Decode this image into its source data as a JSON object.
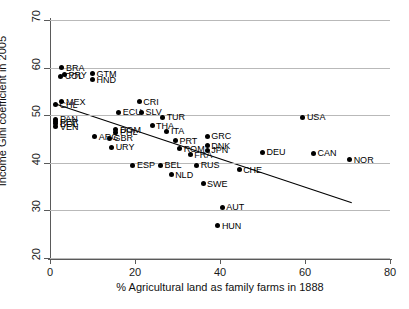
{
  "chart_data": {
    "type": "scatter",
    "title": "",
    "xlabel": "% Agricultural land as family farms in 1888",
    "ylabel": "Income Gini coefficient in 2005",
    "xlim": [
      0,
      80
    ],
    "ylim": [
      20,
      70
    ],
    "xticks": [
      0,
      20,
      40,
      60,
      80
    ],
    "yticks": [
      20,
      30,
      40,
      50,
      60,
      70
    ],
    "grid": "horizontal",
    "legend": "none",
    "trendline": {
      "type": "linear-fit",
      "x_start": 1.5,
      "y_start": 52.3,
      "x_end": 71.0,
      "y_end": 31.6
    },
    "point_label_position": "right",
    "points": [
      {
        "label": "BRA",
        "x": 2.8,
        "y": 60.0
      },
      {
        "label": "PRY",
        "x": 3.4,
        "y": 58.5
      },
      {
        "label": "COL",
        "x": 2.5,
        "y": 58.2
      },
      {
        "label": "GTM",
        "x": 10.0,
        "y": 58.7
      },
      {
        "label": "HND",
        "x": 10.0,
        "y": 57.4
      },
      {
        "label": "MEX",
        "x": 2.8,
        "y": 52.8
      },
      {
        "label": "CHL",
        "x": 1.3,
        "y": 52.2
      },
      {
        "label": "CRI",
        "x": 21.0,
        "y": 52.8
      },
      {
        "label": "ECU",
        "x": 16.2,
        "y": 50.6
      },
      {
        "label": "SLV",
        "x": 21.5,
        "y": 50.6
      },
      {
        "label": "TUR",
        "x": 26.5,
        "y": 49.6
      },
      {
        "label": "PAN",
        "x": 1.4,
        "y": 49.2
      },
      {
        "label": "PER",
        "x": 1.4,
        "y": 48.6
      },
      {
        "label": "BOL",
        "x": 1.4,
        "y": 48.2
      },
      {
        "label": "VEN",
        "x": 1.4,
        "y": 47.6
      },
      {
        "label": "THA",
        "x": 24.0,
        "y": 47.8
      },
      {
        "label": "DOM",
        "x": 15.5,
        "y": 46.9
      },
      {
        "label": "PHL",
        "x": 15.5,
        "y": 46.4
      },
      {
        "label": "ITA",
        "x": 27.5,
        "y": 46.6
      },
      {
        "label": "ARG",
        "x": 10.5,
        "y": 45.5
      },
      {
        "label": "GBR",
        "x": 14.0,
        "y": 45.2
      },
      {
        "label": "PRT",
        "x": 29.5,
        "y": 44.6
      },
      {
        "label": "URY",
        "x": 14.5,
        "y": 43.3
      },
      {
        "label": "GRC",
        "x": 37.0,
        "y": 45.6
      },
      {
        "label": "DNK",
        "x": 37.0,
        "y": 43.6
      },
      {
        "label": "JPN",
        "x": 37.0,
        "y": 42.6
      },
      {
        "label": "ROM",
        "x": 30.5,
        "y": 42.9
      },
      {
        "label": "FRA",
        "x": 33.0,
        "y": 41.7
      },
      {
        "label": "DEU",
        "x": 50.0,
        "y": 42.2
      },
      {
        "label": "USA",
        "x": 59.5,
        "y": 49.6
      },
      {
        "label": "CAN",
        "x": 62.0,
        "y": 42.0
      },
      {
        "label": "NOR",
        "x": 70.5,
        "y": 40.6
      },
      {
        "label": "ESP",
        "x": 19.5,
        "y": 39.5
      },
      {
        "label": "BEL",
        "x": 26.0,
        "y": 39.5
      },
      {
        "label": "RUS",
        "x": 34.5,
        "y": 39.5
      },
      {
        "label": "CHE",
        "x": 44.5,
        "y": 38.5
      },
      {
        "label": "NLD",
        "x": 28.5,
        "y": 37.5
      },
      {
        "label": "SWE",
        "x": 36.0,
        "y": 35.6
      },
      {
        "label": "AUT",
        "x": 40.5,
        "y": 30.7
      },
      {
        "label": "HUN",
        "x": 39.5,
        "y": 26.8
      }
    ]
  },
  "colors": {
    "point": "#000000",
    "grid": "#b9b9b9",
    "axis": "#5a5a5a",
    "text": "#111111",
    "background": "#ffffff"
  }
}
